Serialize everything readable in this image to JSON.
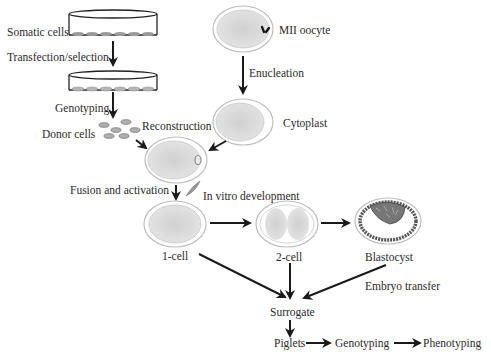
{
  "diagram": {
    "labels": {
      "somatic_cells": "Somatic cells",
      "transfection_selection": "Transfection/selection",
      "genotyping_top": "Genotyping",
      "donor_cells": "Donor cells",
      "reconstruction": "Reconstruction",
      "mii_oocyte": "MII oocyte",
      "enucleation": "Enucleation",
      "cytoplast": "Cytoplast",
      "fusion_activation": "Fusion and activation",
      "in_vitro_development": "In vitro development",
      "one_cell": "1-cell",
      "two_cell": "2-cell",
      "blastocyst": "Blastocyst",
      "embryo_transfer": "Embryo transfer",
      "surrogate": "Surrogate",
      "piglets": "Piglets",
      "genotyping_bottom": "Genotyping",
      "phenotyping": "Phenotyping"
    },
    "colors": {
      "arrow": "#1a1a1a",
      "cell_fill": "#d8d8d8",
      "zona": "#b8b8b8",
      "text": "#2a2a2a",
      "dish_cell": "#9a9a9a"
    }
  }
}
